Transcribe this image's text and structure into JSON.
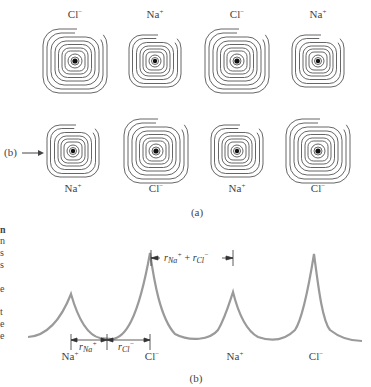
{
  "panel_a": {
    "caption": "(a)",
    "row_pointer_label": "(b)",
    "top_row": [
      {
        "ion": "Cl",
        "charge": "−",
        "cx": 75,
        "cy": 61,
        "size": "large"
      },
      {
        "ion": "Na",
        "charge": "+",
        "cx": 155,
        "cy": 61,
        "size": "small"
      },
      {
        "ion": "Cl",
        "charge": "−",
        "cx": 237,
        "cy": 61,
        "size": "large"
      },
      {
        "ion": "Na",
        "charge": "+",
        "cx": 318,
        "cy": 61,
        "size": "small"
      }
    ],
    "bottom_row": [
      {
        "ion": "Na",
        "charge": "+",
        "cx": 73,
        "cy": 151,
        "size": "small"
      },
      {
        "ion": "Cl",
        "charge": "−",
        "cx": 156,
        "cy": 151,
        "size": "large"
      },
      {
        "ion": "Na",
        "charge": "+",
        "cx": 237,
        "cy": 151,
        "size": "small"
      },
      {
        "ion": "Cl",
        "charge": "−",
        "cx": 318,
        "cy": 151,
        "size": "large"
      }
    ]
  },
  "panel_b": {
    "caption": "(b)",
    "ion_labels": [
      {
        "ion": "Na",
        "charge": "+",
        "x": 74
      },
      {
        "ion": "Cl",
        "charge": "−",
        "x": 152
      },
      {
        "ion": "Na",
        "charge": "+",
        "x": 235
      },
      {
        "ion": "Cl",
        "charge": "−",
        "x": 316
      }
    ],
    "annotations": {
      "r_na": {
        "r": "r",
        "sub": "Na",
        "sup": "+"
      },
      "r_cl": {
        "r": "r",
        "sub": "Cl",
        "sup": "−"
      },
      "sum": {
        "r1": "r",
        "sub1": "Na",
        "sup1": "+",
        "plus": "+",
        "r2": "r",
        "sub2": "Cl",
        "sup2": "−"
      }
    }
  },
  "side_text_fragments": [
    "n",
    "n",
    "s",
    "s",
    "e",
    "t",
    "e",
    "e"
  ],
  "colors": {
    "contour": "#555555",
    "curve": "#9a9a9a",
    "nucleus": "#111111",
    "text": "#444444"
  }
}
